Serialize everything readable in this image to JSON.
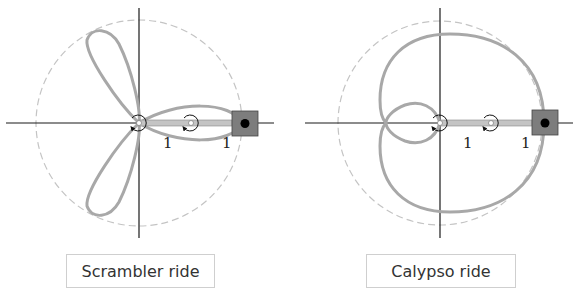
{
  "diagrams": [
    {
      "id": "scrambler",
      "caption": "Scrambler ride",
      "curve": "three-petal rose",
      "arm_labels": [
        "1",
        "1"
      ],
      "colors": {
        "curve": "#a6a6a6",
        "circle": "#bcbcbc",
        "arm": "#bdbdbd",
        "box": "#7a7a7a",
        "axis": "#1a1a1a"
      }
    },
    {
      "id": "calypso",
      "caption": "Calypso ride",
      "curve": "limaçon with inner loop",
      "arm_labels": [
        "1",
        "1"
      ],
      "colors": {
        "curve": "#a6a6a6",
        "circle": "#bcbcbc",
        "arm": "#bdbdbd",
        "box": "#7a7a7a",
        "axis": "#1a1a1a"
      }
    }
  ]
}
